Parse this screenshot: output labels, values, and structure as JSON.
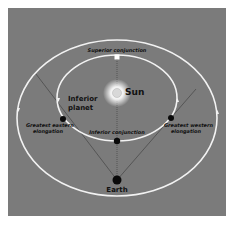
{
  "diagram": {
    "colors": {
      "background": "#7b7b7b",
      "orbit": "#f2f2f2",
      "sight_line": "#3a3a3a",
      "planet": "#0a0a0a",
      "sun_glow": "#ffffff",
      "text": "#111111"
    },
    "labels": {
      "superior_conjunction": "Superior conjunction",
      "sun": "Sun",
      "inferior_planet_line1": "Inferior",
      "inferior_planet_line2": "planet",
      "greatest_eastern_line1": "Greatest eastern",
      "greatest_eastern_line2": "elongation",
      "greatest_western_line1": "Greatest western",
      "greatest_western_line2": "elongation",
      "inferior_conjunction": "Inferior conjunction",
      "earth": "Earth"
    },
    "bodies": [
      {
        "name": "Sun",
        "x": 117,
        "y": 93
      },
      {
        "name": "Superior conjunction",
        "x": 117,
        "y": 57
      },
      {
        "name": "Greatest eastern elongation",
        "x": 63,
        "y": 119
      },
      {
        "name": "Greatest western elongation",
        "x": 171,
        "y": 118
      },
      {
        "name": "Inferior conjunction",
        "x": 117,
        "y": 141
      },
      {
        "name": "Earth",
        "x": 117,
        "y": 180
      }
    ]
  }
}
